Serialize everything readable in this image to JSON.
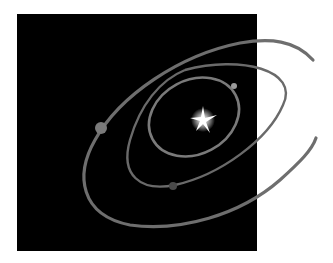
{
  "illustration": {
    "label": "Planetary orbits around a star",
    "background_color": "#ffffff",
    "space_color": "#000000",
    "orbit_color": "#6e6e6e",
    "star": {
      "name": "star",
      "cx": 203,
      "cy": 120,
      "color": "#ffffff"
    },
    "orbits": [
      {
        "name": "inner-orbit"
      },
      {
        "name": "middle-orbit"
      },
      {
        "name": "outer-orbit"
      }
    ],
    "planets": [
      {
        "name": "inner-planet",
        "cx": 234,
        "cy": 86,
        "r": 3,
        "color": "#9a9a9a"
      },
      {
        "name": "middle-planet",
        "cx": 173,
        "cy": 186,
        "r": 4,
        "color": "#4a4a4a"
      },
      {
        "name": "outer-planet",
        "cx": 101,
        "cy": 128,
        "r": 6,
        "color": "#7a7a7a"
      }
    ]
  }
}
